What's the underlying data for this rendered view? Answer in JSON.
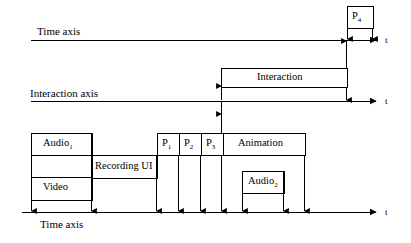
{
  "diagram": {
    "stroke_color": "#000000",
    "background_color": "#ffffff",
    "axes": [
      {
        "id": "top-time-axis",
        "label": "Time axis",
        "tick_label": "t",
        "y": 40
      },
      {
        "id": "interaction-axis",
        "label": "Interaction axis",
        "tick_label": "t",
        "y": 101
      },
      {
        "id": "bottom-time-axis",
        "label": "Time axis",
        "tick_label": "t",
        "y": 212
      }
    ],
    "boxes": [
      {
        "id": "p4",
        "label": "P",
        "subscript": "4",
        "x": 347,
        "y": 6,
        "w": 26,
        "h": 22
      },
      {
        "id": "interaction",
        "label": "Interaction",
        "subscript": "",
        "x": 221,
        "y": 68,
        "w": 126,
        "h": 19
      },
      {
        "id": "audio1",
        "label": "Audio",
        "subscript": "1",
        "x": 31,
        "y": 133,
        "w": 61,
        "h": 22
      },
      {
        "id": "video",
        "label": "Video",
        "subscript": "",
        "x": 31,
        "y": 177,
        "w": 61,
        "h": 23
      },
      {
        "id": "recording-ui",
        "label": "Recording UI",
        "subscript": "",
        "x": 92,
        "y": 155,
        "w": 65,
        "h": 23
      },
      {
        "id": "p1",
        "label": "P",
        "subscript": "1",
        "x": 157,
        "y": 133,
        "w": 22,
        "h": 22
      },
      {
        "id": "p2",
        "label": "P",
        "subscript": "2",
        "x": 179,
        "y": 133,
        "w": 22,
        "h": 22
      },
      {
        "id": "p3",
        "label": "P",
        "subscript": "3",
        "x": 201,
        "y": 133,
        "w": 22,
        "h": 22
      },
      {
        "id": "animation",
        "label": "Animation",
        "subscript": "",
        "x": 223,
        "y": 133,
        "w": 82,
        "h": 22
      },
      {
        "id": "audio2",
        "label": "Audio",
        "subscript": "2",
        "x": 242,
        "y": 171,
        "w": 42,
        "h": 22
      }
    ]
  }
}
